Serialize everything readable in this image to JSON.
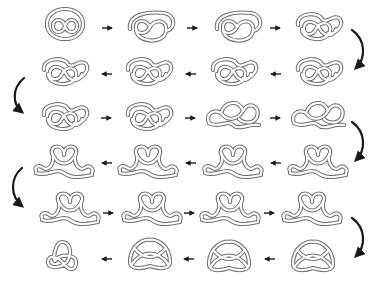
{
  "diagram": {
    "title": "",
    "layout": {
      "rows": 6,
      "cols": 4,
      "flow": "snake"
    },
    "colors": {
      "tube_outline": "#6e6e6e",
      "tube_fill": "#ffffff",
      "arrow": "#1a1a1a",
      "background": "#ffffff"
    },
    "rows": [
      {
        "direction": "right",
        "steps": [
          "knot-1",
          "knot-2",
          "knot-3",
          "knot-4"
        ]
      },
      {
        "direction": "left",
        "steps": [
          "knot-5",
          "knot-6",
          "knot-7",
          "knot-8"
        ]
      },
      {
        "direction": "right",
        "steps": [
          "knot-9",
          "knot-10",
          "knot-11",
          "knot-12"
        ]
      },
      {
        "direction": "left",
        "steps": [
          "knot-13",
          "knot-14",
          "knot-15",
          "knot-16"
        ]
      },
      {
        "direction": "right",
        "steps": [
          "knot-17",
          "knot-18",
          "knot-19",
          "knot-20"
        ]
      },
      {
        "direction": "left",
        "steps": [
          "knot-21",
          "knot-22",
          "knot-23",
          "knot-24"
        ]
      }
    ],
    "final_state": "trefoil knot",
    "connectors": {
      "straight_arrows": 18,
      "curved_arrows": 5
    }
  }
}
